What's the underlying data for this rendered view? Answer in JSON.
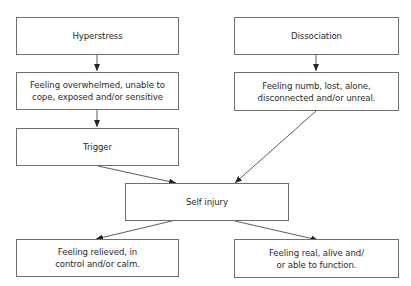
{
  "nodes": {
    "hyperstress": {
      "label": "Hyperstress"
    },
    "dissociation": {
      "label": "Dissociation"
    },
    "overwhelmed": {
      "line1": "Feeling overwhelmed, unable to",
      "line2": "cope, exposed and/or sensitive"
    },
    "numb": {
      "line1": "Feeling numb, lost, alone,",
      "line2": "disconnected and/or unreal."
    },
    "trigger": {
      "label": "Trigger"
    },
    "self_injury": {
      "label": "Self injury"
    },
    "relieved": {
      "line1": "Feeling relieved, in",
      "line2": "control and/or calm."
    },
    "real": {
      "line1": "Feeling real, alive and/",
      "line2": "or able to function."
    }
  },
  "edges": [
    {
      "from": "hyperstress",
      "to": "overwhelmed"
    },
    {
      "from": "overwhelmed",
      "to": "trigger"
    },
    {
      "from": "dissociation",
      "to": "numb"
    },
    {
      "from": "trigger",
      "to": "self_injury"
    },
    {
      "from": "numb",
      "to": "self_injury"
    },
    {
      "from": "self_injury",
      "to": "relieved"
    },
    {
      "from": "self_injury",
      "to": "real"
    }
  ]
}
